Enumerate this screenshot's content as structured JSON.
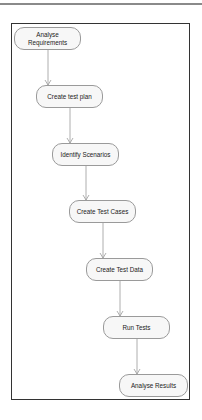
{
  "diagram": {
    "type": "flowchart",
    "direction": "top-to-bottom-staircase",
    "colors": {
      "frame_border": "#333333",
      "node_fill": "#f7f7f7",
      "node_border": "#9a9a9a",
      "edge": "#9a9a9a",
      "text": "#222222"
    },
    "nodes": [
      {
        "id": "n1",
        "label": "Analyse Requirements",
        "line1": "Analyse",
        "line2": "Requirements",
        "x": 14,
        "y": 27,
        "w": 67
      },
      {
        "id": "n2",
        "label": "Create test plan",
        "x": 36,
        "y": 85,
        "w": 67
      },
      {
        "id": "n3",
        "label": "Identify Scenarios",
        "x": 52,
        "y": 143,
        "w": 67
      },
      {
        "id": "n4",
        "label": "Create Test Cases",
        "x": 69,
        "y": 200,
        "w": 67
      },
      {
        "id": "n5",
        "label": "Create Test Data",
        "x": 86,
        "y": 258,
        "w": 67
      },
      {
        "id": "n6",
        "label": "Run Tests",
        "x": 103,
        "y": 316,
        "w": 67
      },
      {
        "id": "n7",
        "label": "Analyse Results",
        "x": 119,
        "y": 374,
        "w": 69
      }
    ],
    "edges": [
      {
        "from": "n1",
        "to": "n2"
      },
      {
        "from": "n2",
        "to": "n3"
      },
      {
        "from": "n3",
        "to": "n4"
      },
      {
        "from": "n4",
        "to": "n5"
      },
      {
        "from": "n5",
        "to": "n6"
      },
      {
        "from": "n6",
        "to": "n7"
      }
    ]
  }
}
